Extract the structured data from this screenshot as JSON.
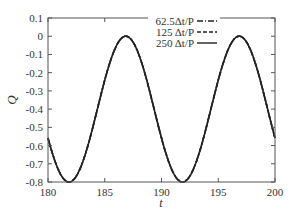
{
  "chart_data": {
    "type": "line",
    "title": "",
    "xlabel": "t",
    "ylabel": "Q",
    "xlim": [
      180,
      200
    ],
    "ylim": [
      -0.8,
      0.1
    ],
    "xticks": [
      180,
      185,
      190,
      195,
      200
    ],
    "xtick_labels": [
      "180",
      "185",
      "190",
      "195",
      "200"
    ],
    "yticks": [
      0.1,
      0,
      -0.1,
      -0.2,
      -0.3,
      -0.4,
      -0.5,
      -0.6,
      -0.7,
      -0.8
    ],
    "ytick_labels": [
      "0.1",
      "0",
      "-0.1",
      "-0.2",
      "-0.3",
      "-0.4",
      "-0.5",
      "-0.6",
      "-0.7",
      "-0.8"
    ],
    "grid": false,
    "legend_position": "top-center-inside",
    "x": [
      180,
      181,
      182,
      183,
      184,
      185,
      186,
      186.8,
      188,
      189,
      190,
      191,
      192,
      193,
      194,
      195,
      196,
      196.8,
      198,
      199,
      200
    ],
    "series": [
      {
        "name": "62.5Δt/P",
        "style": "dash-dot",
        "values": [
          -0.53,
          -0.71,
          -0.8,
          -0.73,
          -0.55,
          -0.31,
          -0.09,
          0.0,
          -0.1,
          -0.29,
          -0.53,
          -0.71,
          -0.8,
          -0.73,
          -0.55,
          -0.31,
          -0.09,
          0.0,
          -0.1,
          -0.29,
          -0.53
        ]
      },
      {
        "name": "125 Δt/P",
        "style": "dashed",
        "values": [
          -0.53,
          -0.71,
          -0.8,
          -0.73,
          -0.55,
          -0.31,
          -0.09,
          0.0,
          -0.1,
          -0.29,
          -0.53,
          -0.71,
          -0.8,
          -0.73,
          -0.55,
          -0.31,
          -0.09,
          0.0,
          -0.1,
          -0.29,
          -0.53
        ]
      },
      {
        "name": "250 Δt/P",
        "style": "solid",
        "values": [
          -0.53,
          -0.71,
          -0.8,
          -0.73,
          -0.55,
          -0.31,
          -0.09,
          0.0,
          -0.1,
          -0.29,
          -0.53,
          -0.71,
          -0.8,
          -0.73,
          -0.55,
          -0.31,
          -0.09,
          0.0,
          -0.1,
          -0.29,
          -0.53
        ]
      }
    ],
    "model": {
      "form": "Q = mean + amp*cos(2*pi*(t - t_peak)/period)",
      "mean": -0.4,
      "amp": 0.4,
      "t_peak": 186.85,
      "period": 10.0
    }
  },
  "colors": {
    "line": "#222222",
    "axis": "#555555",
    "text": "#333333"
  }
}
